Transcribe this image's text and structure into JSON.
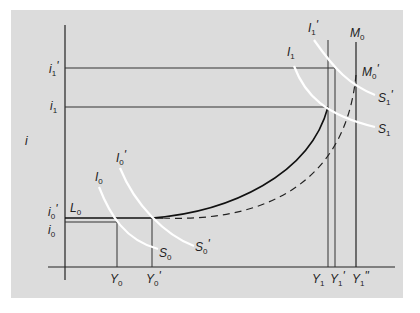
{
  "diagram": {
    "type": "IS-LM style economics diagram",
    "axis": {
      "y_label": "i",
      "x_label": ""
    },
    "y_ticks": [
      {
        "label": "i",
        "sub": "1",
        "prime": "'"
      },
      {
        "label": "i",
        "sub": "1",
        "prime": ""
      },
      {
        "label": "i",
        "sub": "0",
        "prime": "'"
      },
      {
        "label": "i",
        "sub": "0",
        "prime": ""
      }
    ],
    "x_ticks": [
      {
        "label": "Y",
        "sub": "0",
        "prime": ""
      },
      {
        "label": "Y",
        "sub": "0",
        "prime": "'"
      },
      {
        "label": "Y",
        "sub": "1",
        "prime": ""
      },
      {
        "label": "Y",
        "sub": "1",
        "prime": "'"
      },
      {
        "label": "Y",
        "sub": "1",
        "prime": "\""
      }
    ],
    "curves": {
      "L0": {
        "label": "L",
        "sub": "0",
        "prime": ""
      },
      "M0": {
        "label": "M",
        "sub": "0",
        "prime": ""
      },
      "M0p": {
        "label": "M",
        "sub": "0",
        "prime": "'"
      },
      "I0": {
        "label": "I",
        "sub": "0",
        "prime": ""
      },
      "I0p": {
        "label": "I",
        "sub": "0",
        "prime": "'"
      },
      "I1": {
        "label": "I",
        "sub": "1",
        "prime": ""
      },
      "I1p": {
        "label": "I",
        "sub": "1",
        "prime": "'"
      },
      "S0": {
        "label": "S",
        "sub": "0",
        "prime": ""
      },
      "S0p": {
        "label": "S",
        "sub": "0",
        "prime": "'"
      },
      "S1": {
        "label": "S",
        "sub": "1",
        "prime": ""
      },
      "S1p": {
        "label": "S",
        "sub": "1",
        "prime": "'"
      }
    },
    "colors": {
      "background": "#dcdcdc",
      "line": "#222222",
      "is_curves": "#ffffff"
    }
  }
}
